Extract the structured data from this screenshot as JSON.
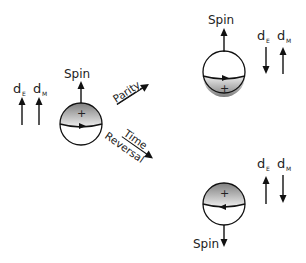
{
  "diagram": {
    "colors": {
      "stroke": "#111111",
      "shade_dark": "#8a8a8a",
      "shade_light": "#e8e8e8",
      "background": "#ffffff"
    },
    "original": {
      "spin_label": "Spin",
      "spin_direction": "up",
      "de_label": "d",
      "de_sub": "E",
      "de_direction": "up",
      "dm_label": "d",
      "dm_sub": "M",
      "dm_direction": "up",
      "charge_symbol": "+"
    },
    "transforms": [
      {
        "label": "Parity",
        "direction": "to-upper-right"
      },
      {
        "label_line1": "Time",
        "label_line2": "Reversal",
        "direction": "to-lower-right"
      }
    ],
    "parity_result": {
      "spin_label": "Spin",
      "spin_direction": "up",
      "de_label": "d",
      "de_sub": "E",
      "de_direction": "down",
      "dm_label": "d",
      "dm_sub": "M",
      "dm_direction": "up",
      "charge_symbol": "+"
    },
    "time_reversal_result": {
      "spin_label": "Spin",
      "spin_direction": "down",
      "de_label": "d",
      "de_sub": "E",
      "de_direction": "up",
      "dm_label": "d",
      "dm_sub": "M",
      "dm_direction": "down",
      "charge_symbol": "+"
    }
  }
}
